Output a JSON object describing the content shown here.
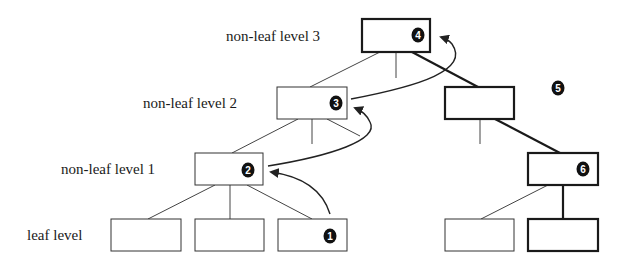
{
  "diagram": {
    "type": "tree-traversal",
    "level_labels": [
      {
        "id": "level3",
        "text": "non-leaf level 3"
      },
      {
        "id": "level2",
        "text": "non-leaf level 2"
      },
      {
        "id": "level1",
        "text": "non-leaf level 1"
      },
      {
        "id": "leaf",
        "text": "leaf level"
      }
    ],
    "step_markers": [
      {
        "id": "step1",
        "text": "1"
      },
      {
        "id": "step2",
        "text": "2"
      },
      {
        "id": "step3",
        "text": "3"
      },
      {
        "id": "step4",
        "text": "4"
      },
      {
        "id": "step5",
        "text": "5"
      },
      {
        "id": "step6",
        "text": "6"
      }
    ],
    "nodes": [
      {
        "id": "root",
        "level": 3,
        "marker": "4",
        "bold": false
      },
      {
        "id": "l2-left",
        "level": 2,
        "marker": "3",
        "bold": false
      },
      {
        "id": "l2-right",
        "level": 2,
        "marker": null,
        "bold": true
      },
      {
        "id": "l1-left",
        "level": 1,
        "marker": "2",
        "bold": false
      },
      {
        "id": "l1-right",
        "level": 1,
        "marker": "6",
        "bold": true
      },
      {
        "id": "leaf-1",
        "level": 0,
        "marker": null,
        "bold": false
      },
      {
        "id": "leaf-2",
        "level": 0,
        "marker": null,
        "bold": false
      },
      {
        "id": "leaf-3",
        "level": 0,
        "marker": "1",
        "bold": false
      },
      {
        "id": "leaf-4",
        "level": 0,
        "marker": null,
        "bold": false
      },
      {
        "id": "leaf-5",
        "level": 0,
        "marker": null,
        "bold": true
      }
    ],
    "arrows": [
      {
        "from": "leaf-3",
        "to": "l1-left"
      },
      {
        "from": "l1-left",
        "to": "l2-left"
      },
      {
        "from": "l2-left",
        "to": "root"
      }
    ],
    "colors": {
      "stroke": "#333333",
      "bold_stroke": "#1a1a1a",
      "marker_fill": "#111111",
      "marker_text": "#ffffff",
      "background": "#ffffff"
    }
  }
}
